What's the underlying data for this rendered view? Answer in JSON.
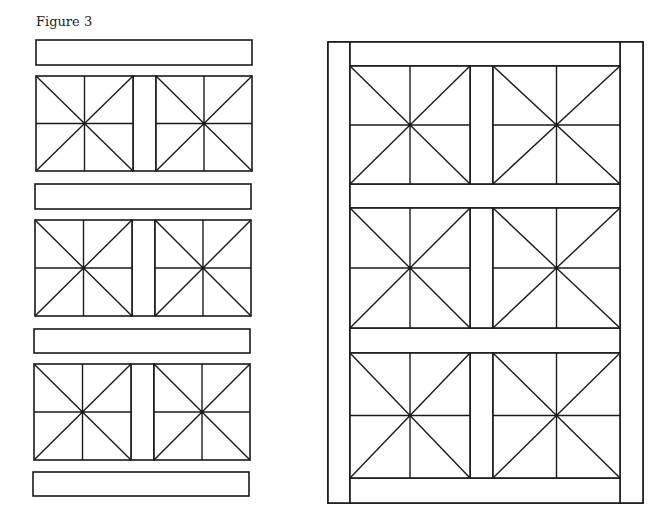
{
  "figure": {
    "title": "Figure 3",
    "stroke_color": "#1a1a1a",
    "background": "#ffffff"
  },
  "left_exploded_layout": {
    "description": "Quilt rows shown separated: horizontal sashing strips alternating with rows of two quarter-square/star blocks joined by a vertical sash",
    "strips": [
      {
        "x": 36,
        "y": 40,
        "w": 216,
        "h": 25
      },
      {
        "x": 35,
        "y": 184,
        "w": 216,
        "h": 25
      },
      {
        "x": 34,
        "y": 329,
        "w": 216,
        "h": 24
      },
      {
        "x": 33,
        "y": 472,
        "w": 216,
        "h": 24
      }
    ],
    "block_rows": [
      {
        "y": 76,
        "h": 95,
        "blocks": [
          {
            "x": 36,
            "w": 97
          },
          {
            "x": 156,
            "w": 96
          }
        ]
      },
      {
        "y": 220,
        "h": 96,
        "blocks": [
          {
            "x": 35,
            "w": 97
          },
          {
            "x": 155,
            "w": 96
          }
        ]
      },
      {
        "y": 364,
        "h": 96,
        "blocks": [
          {
            "x": 34,
            "w": 97
          },
          {
            "x": 154,
            "w": 96
          }
        ]
      }
    ]
  },
  "right_assembled_quilt": {
    "outer": {
      "x": 328,
      "y": 42,
      "w": 315,
      "h": 461
    },
    "side_borders": [
      {
        "x": 328,
        "y": 42,
        "w": 22,
        "h": 461
      },
      {
        "x": 620,
        "y": 42,
        "w": 23,
        "h": 461
      }
    ],
    "horizontal_sashing": [
      {
        "x": 350,
        "y": 42,
        "w": 270,
        "h": 24
      },
      {
        "x": 350,
        "y": 184,
        "w": 270,
        "h": 24
      },
      {
        "x": 350,
        "y": 328,
        "w": 270,
        "h": 25
      },
      {
        "x": 350,
        "y": 478,
        "w": 270,
        "h": 25
      }
    ],
    "block_rows": [
      {
        "y": 66,
        "h": 118,
        "blocks": [
          {
            "x": 350,
            "w": 120
          },
          {
            "x": 493,
            "w": 127
          }
        ]
      },
      {
        "y": 208,
        "h": 120,
        "blocks": [
          {
            "x": 350,
            "w": 120
          },
          {
            "x": 493,
            "w": 127
          }
        ]
      },
      {
        "y": 353,
        "h": 125,
        "blocks": [
          {
            "x": 350,
            "w": 120
          },
          {
            "x": 493,
            "w": 127
          }
        ]
      }
    ]
  }
}
